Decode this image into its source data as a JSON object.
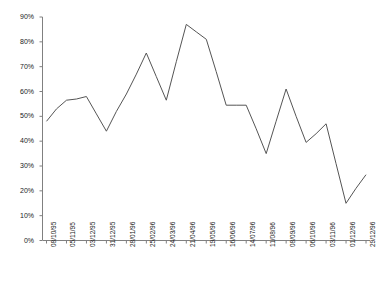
{
  "chart_data": {
    "type": "line",
    "title": "",
    "subtitle": "",
    "xlabel": "",
    "ylabel": "",
    "grid": false,
    "legend": "none",
    "ylim": [
      0,
      90
    ],
    "ytick_labels": [
      "0%",
      "10%",
      "20%",
      "30%",
      "40%",
      "50%",
      "60%",
      "70%",
      "80%",
      "90%"
    ],
    "ytick_values": [
      0,
      10,
      20,
      30,
      40,
      50,
      60,
      70,
      80,
      90
    ],
    "categories": [
      "08/10/95",
      "05/11/95",
      "03/12/95",
      "31/12/95",
      "28/01/96",
      "25/02/96",
      "24/03/96",
      "21/04/96",
      "19/05/96",
      "16/06/96",
      "14/07/96",
      "11/08/96",
      "08/09/96",
      "06/10/96",
      "03/11/96",
      "01/12/96",
      "29/12/96"
    ],
    "series": [
      {
        "name": "series-1",
        "values": [
          48,
          56.5,
          58,
          44,
          59,
          75.5,
          56.5,
          87,
          81,
          54.5,
          54.5,
          35,
          61,
          39.5,
          47,
          15,
          26.5
        ]
      }
    ],
    "points": [
      {
        "x": "08/10/95",
        "y": 48
      },
      {
        "x": "22/10/95",
        "y": 53
      },
      {
        "x": "05/11/95",
        "y": 56.5
      },
      {
        "x": "19/11/95",
        "y": 57
      },
      {
        "x": "03/12/95",
        "y": 58
      },
      {
        "x": "17/12/95",
        "y": 51
      },
      {
        "x": "31/12/95",
        "y": 44
      },
      {
        "x": "14/01/96",
        "y": 52
      },
      {
        "x": "28/01/96",
        "y": 59
      },
      {
        "x": "11/02/96",
        "y": 67
      },
      {
        "x": "25/02/96",
        "y": 75.5
      },
      {
        "x": "10/03/96",
        "y": 66
      },
      {
        "x": "24/03/96",
        "y": 56.5
      },
      {
        "x": "07/04/96",
        "y": 72
      },
      {
        "x": "21/04/96",
        "y": 87
      },
      {
        "x": "05/05/96",
        "y": 84
      },
      {
        "x": "19/05/96",
        "y": 81
      },
      {
        "x": "02/06/96",
        "y": 68
      },
      {
        "x": "16/06/96",
        "y": 54.5
      },
      {
        "x": "30/06/96",
        "y": 54.5
      },
      {
        "x": "14/07/96",
        "y": 54.5
      },
      {
        "x": "28/07/96",
        "y": 45
      },
      {
        "x": "11/08/96",
        "y": 35
      },
      {
        "x": "25/08/96",
        "y": 48
      },
      {
        "x": "08/09/96",
        "y": 61
      },
      {
        "x": "22/09/96",
        "y": 50
      },
      {
        "x": "06/10/96",
        "y": 39.5
      },
      {
        "x": "20/10/96",
        "y": 43
      },
      {
        "x": "03/11/96",
        "y": 47
      },
      {
        "x": "17/11/96",
        "y": 31
      },
      {
        "x": "01/12/96",
        "y": 15
      },
      {
        "x": "15/12/96",
        "y": 21
      },
      {
        "x": "29/12/96",
        "y": 26.5
      }
    ],
    "line_color": "#555555",
    "axis_color": "#808080"
  }
}
